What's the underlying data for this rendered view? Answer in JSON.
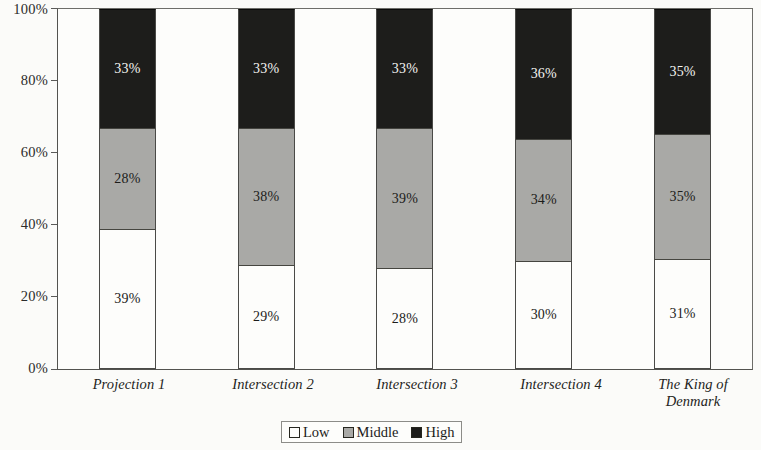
{
  "chart_data": {
    "type": "bar",
    "subtype": "100% stacked column",
    "title": "",
    "xlabel": "",
    "ylabel": "",
    "ylim": [
      0,
      100
    ],
    "ytick_labels": [
      "100%",
      "80%",
      "60%",
      "40%",
      "20%",
      "0%"
    ],
    "ytick_values": [
      100,
      80,
      60,
      40,
      20,
      0
    ],
    "grid": false,
    "legend_position": "bottom-center",
    "categories": [
      "Projection 1",
      "Intersection 2",
      "Intersection 3",
      "Intersection 4",
      "The King of Denmark"
    ],
    "series": [
      {
        "name": "Low",
        "color": "#fdfdfb",
        "values": [
          39,
          29,
          28,
          30,
          31
        ],
        "labels": [
          "39%",
          "29%",
          "28%",
          "30%",
          "31%"
        ]
      },
      {
        "name": "Middle",
        "color": "#a9a9a6",
        "values": [
          28,
          38,
          39,
          34,
          35
        ],
        "labels": [
          "28%",
          "38%",
          "39%",
          "34%",
          "35%"
        ]
      },
      {
        "name": "High",
        "color": "#1d1d1b",
        "values": [
          33,
          33,
          33,
          36,
          35
        ],
        "labels": [
          "33%",
          "33%",
          "33%",
          "36%",
          "35%"
        ]
      }
    ]
  },
  "legend": {
    "items": [
      {
        "label": "Low"
      },
      {
        "label": "Middle"
      },
      {
        "label": "High"
      }
    ]
  }
}
